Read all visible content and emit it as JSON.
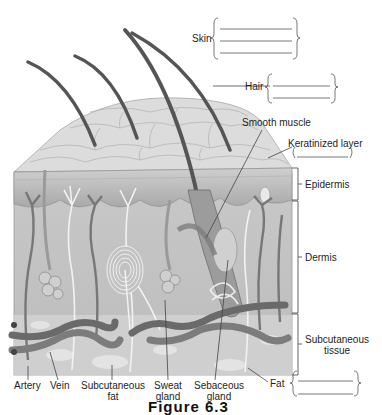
{
  "figure": {
    "title": "Figure 6.3"
  },
  "labels": {
    "skin": "Skin",
    "hair": "Hair",
    "smooth_muscle": "Smooth muscle",
    "keratinized_layer": "Keratinized layer",
    "epidermis": "Epidermis",
    "dermis": "Dermis",
    "subcutaneous_tissue_line1": "Subcutaneous",
    "subcutaneous_tissue_line2": "tissue",
    "artery": "Artery",
    "vein": "Vein",
    "subcutaneous_fat_line1": "Subcutaneous",
    "subcutaneous_fat_line2": "fat",
    "sweat_gland_line1": "Sweat",
    "sweat_gland_line2": "gland",
    "sebaceous_gland_line1": "Sebaceous",
    "sebaceous_gland_line2": "gland",
    "fat": "Fat"
  },
  "blanks": {
    "skin": [
      "",
      "",
      ""
    ],
    "hair": [
      "",
      ""
    ],
    "keratinized_layer": [
      ""
    ],
    "fat": [
      "",
      ""
    ]
  },
  "colors": {
    "line": "#555555",
    "tissue_light": "#d9d9d9",
    "tissue_mid": "#bdbdbd",
    "tissue_dark": "#8a8a8a",
    "hair": "#5a5a5a",
    "vessel": "#6e6e6e"
  }
}
